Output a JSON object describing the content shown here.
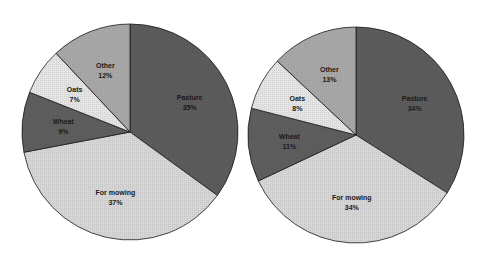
{
  "chart_data": [
    {
      "type": "pie",
      "title": "",
      "start_angle": "12 o'clock, clockwise",
      "center": [
        130,
        132
      ],
      "radius": 108,
      "categories": [
        "Pasture",
        "For mowing",
        "Wheat",
        "Oats",
        "Other"
      ],
      "values": [
        35,
        37,
        9,
        7,
        12
      ],
      "labels": [
        "35%",
        "37%",
        "9%",
        "7%",
        "12%"
      ],
      "colors": [
        "#5c5c5c",
        "#d6d6d6",
        "#5e5e5e",
        "#e4e4e4",
        "#a8a8a8"
      ],
      "legend": "none (data labels inside slices)"
    },
    {
      "type": "pie",
      "title": "",
      "start_angle": "12 o'clock, clockwise",
      "center": [
        356,
        135
      ],
      "radius": 108,
      "categories": [
        "Pasture",
        "For mowing",
        "Wheat",
        "Oats",
        "Other"
      ],
      "values": [
        34,
        34,
        11,
        8,
        13
      ],
      "labels": [
        "34%",
        "34%",
        "11%",
        "8%",
        "13%"
      ],
      "colors": [
        "#5c5c5c",
        "#d6d6d6",
        "#5e5e5e",
        "#e4e4e4",
        "#a8a8a8"
      ],
      "legend": "none (data labels inside slices)"
    }
  ]
}
